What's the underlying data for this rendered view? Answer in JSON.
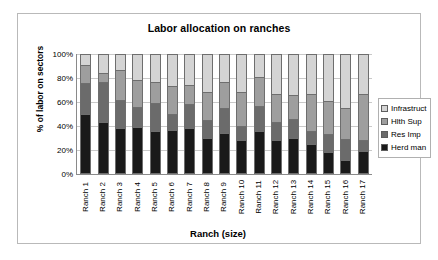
{
  "chart_data": {
    "type": "bar",
    "stacked": true,
    "stack_mode": "percent",
    "title": "Labor allocation on ranches",
    "xlabel": "Ranch  (size)",
    "ylabel": "% of labor on sectors",
    "ylim": [
      0,
      100
    ],
    "yticks": [
      "0%",
      "20%",
      "40%",
      "60%",
      "80%",
      "100%"
    ],
    "ytick_values": [
      0,
      20,
      40,
      60,
      80,
      100
    ],
    "grid": true,
    "legend_position": "right",
    "categories": [
      "Ranch 1",
      "Ranch 2",
      "Ranch 3",
      "Ranch 4",
      "Ranch 5",
      "Ranch 6",
      "Ranch 7",
      "Ranch 8",
      "Ranch 9",
      "Ranch 10",
      "Ranch 11",
      "Ranch 12",
      "Ranch 13",
      "Ranch 14",
      "Ranch 15",
      "Ranch 16",
      "Ranch 17"
    ],
    "series": [
      {
        "name": "Herd man",
        "color": "#1a1a1a",
        "values": [
          50,
          43,
          38,
          39,
          36,
          37,
          38,
          30,
          34,
          28,
          36,
          28,
          30,
          25,
          18,
          12,
          19
        ]
      },
      {
        "name": "Res Imp",
        "color": "#6b6b6b",
        "values": [
          26,
          34,
          24,
          17,
          23,
          13,
          20,
          15,
          21,
          12,
          21,
          15,
          16,
          11,
          15,
          17,
          9
        ]
      },
      {
        "name": "Hlth Sup",
        "color": "#9e9e9e",
        "values": [
          15,
          7,
          25,
          22,
          18,
          23,
          16,
          23,
          22,
          28,
          24,
          24,
          20,
          31,
          28,
          26,
          39
        ]
      },
      {
        "name": "Infrastruct",
        "color": "#d4d4d4",
        "values": [
          9,
          16,
          13,
          22,
          23,
          27,
          26,
          32,
          23,
          32,
          19,
          33,
          34,
          33,
          39,
          45,
          33
        ]
      }
    ],
    "legend_entries": [
      {
        "label": "Infrastruct",
        "color": "#d4d4d4"
      },
      {
        "label": "Hlth Sup",
        "color": "#9e9e9e"
      },
      {
        "label": "Res Imp",
        "color": "#6b6b6b"
      },
      {
        "label": "Herd man",
        "color": "#1a1a1a"
      }
    ]
  }
}
